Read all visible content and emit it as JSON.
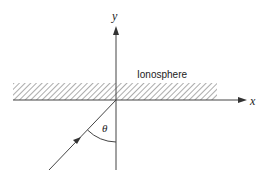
{
  "diagram": {
    "title": "",
    "labels": {
      "y_axis": "y",
      "x_axis": "x",
      "region": "Ionosphere",
      "angle": "θ"
    },
    "elements": {
      "axes": [
        "x-axis",
        "y-axis"
      ],
      "region": "ionosphere layer (hatched band above x-axis)",
      "ray": "incident ray arriving at origin from lower-left",
      "angle": "angle θ between incident ray and y-axis (normal)"
    },
    "colors": {
      "line": "#444444",
      "hatch": "#666666",
      "text": "#222222"
    }
  }
}
